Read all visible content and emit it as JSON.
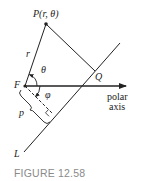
{
  "figure": {
    "caption": "FIGURE 12.58",
    "labels": {
      "point_p": "P(r, θ)",
      "r": "r",
      "theta": "θ",
      "focus": "F",
      "q": "Q",
      "phi": "φ",
      "p": "p",
      "line": "L",
      "polar_axis_line1": "polar",
      "polar_axis_line2": "axis"
    },
    "colors": {
      "stroke": "#222222",
      "caption": "#8a8a8a"
    }
  }
}
